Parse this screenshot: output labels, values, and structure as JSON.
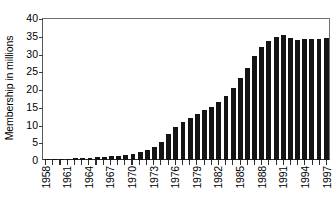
{
  "chart_data": {
    "type": "bar",
    "title": "",
    "xlabel": "",
    "ylabel": "Membership in millions",
    "ylim": [
      0,
      40
    ],
    "ytick_values": [
      0,
      5,
      10,
      15,
      20,
      25,
      30,
      35,
      40
    ],
    "ytick_labels": [
      "0",
      "5",
      "10",
      "15",
      "20",
      "25",
      "30",
      "35",
      "40"
    ],
    "grid": false,
    "legend": "none",
    "bar_color": "#141414",
    "axis_color": "#2b2f32",
    "xtick_label_interval": 3,
    "xtick_labels_shown": [
      "1958",
      "1961",
      "1964",
      "1967",
      "1970",
      "1973",
      "1976",
      "1979",
      "1982",
      "1985",
      "1988",
      "1991",
      "1994",
      "1997"
    ],
    "categories": [
      "1958",
      "1959",
      "1960",
      "1961",
      "1962",
      "1963",
      "1964",
      "1965",
      "1966",
      "1967",
      "1968",
      "1969",
      "1970",
      "1971",
      "1972",
      "1973",
      "1974",
      "1975",
      "1976",
      "1977",
      "1978",
      "1979",
      "1980",
      "1981",
      "1982",
      "1983",
      "1984",
      "1985",
      "1986",
      "1987",
      "1988",
      "1989",
      "1990",
      "1991",
      "1992",
      "1993",
      "1994",
      "1995",
      "1996",
      "1997"
    ],
    "values": [
      0.1,
      0.2,
      0.3,
      0.4,
      0.5,
      0.6,
      0.7,
      0.8,
      0.9,
      1.0,
      1.2,
      1.5,
      1.8,
      2.2,
      2.8,
      3.6,
      5.0,
      7.3,
      9.3,
      10.6,
      11.8,
      12.9,
      14.1,
      15.0,
      16.3,
      18.0,
      20.3,
      23.0,
      26.0,
      29.4,
      31.8,
      33.5,
      34.7,
      35.1,
      34.3,
      33.8,
      34.0,
      34.0,
      34.0,
      34.3
    ]
  }
}
